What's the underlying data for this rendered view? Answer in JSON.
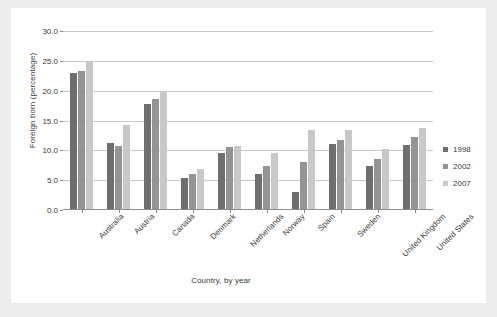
{
  "chart_data": {
    "type": "bar",
    "title": "",
    "xlabel": "Country, by year",
    "ylabel": "Foreign born (percentage)",
    "ylim": [
      0.0,
      30.0
    ],
    "yticks": [
      "0.0",
      "5.0",
      "10.0",
      "15.0",
      "20.0",
      "25.0",
      "30.0"
    ],
    "ytick_values": [
      0.0,
      5.0,
      10.0,
      15.0,
      20.0,
      25.0,
      30.0
    ],
    "grid": true,
    "legend_position": "right",
    "categories": [
      "Australia",
      "Austria",
      "Canada",
      "Denmark",
      "Netherlands",
      "Norway",
      "Spain",
      "Sweden",
      "United Kingdom",
      "United States"
    ],
    "series": [
      {
        "name": "1998",
        "color": "#6e6e6e",
        "values": [
          23.0,
          11.2,
          17.7,
          5.4,
          9.6,
          6.1,
          3.1,
          11.0,
          7.4,
          10.9
        ]
      },
      {
        "name": "2002",
        "color": "#949494",
        "values": [
          23.3,
          10.7,
          18.6,
          6.0,
          10.6,
          7.3,
          8.0,
          11.8,
          8.6,
          12.2
        ]
      },
      {
        "name": "2007",
        "color": "#c8c8c8",
        "values": [
          25.0,
          14.2,
          20.0,
          6.9,
          10.8,
          9.5,
          13.4,
          13.4,
          10.2,
          13.7
        ]
      }
    ]
  },
  "figure": {
    "background_color": "#ececec",
    "panel_color": "#ffffff",
    "grid_color": "#c9c9c9",
    "axis_color": "#8f8f8f",
    "text_color": "#3b3b3b"
  }
}
